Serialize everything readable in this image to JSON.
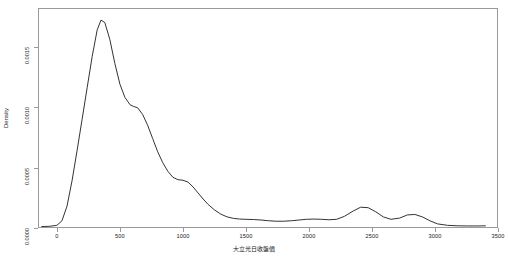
{
  "chart_data": {
    "type": "line",
    "title": "",
    "subtitle": "",
    "xlabel": "大立光日收盤價",
    "ylabel": "Density",
    "xlim": [
      -150,
      3500
    ],
    "ylim": [
      0,
      0.00182
    ],
    "grid": false,
    "legend": null,
    "x_ticks": [
      0,
      500,
      1000,
      1500,
      2000,
      2500,
      3000,
      3500
    ],
    "x_tick_labels": [
      "0",
      "500",
      "1000",
      "1500",
      "2000",
      "2500",
      "3000",
      "3500"
    ],
    "y_ticks": [
      0.0,
      0.0005,
      0.001,
      0.0015
    ],
    "y_tick_labels": [
      "0.0000",
      "0.0005",
      "0.0010",
      "0.0015"
    ],
    "line_color": "#333333",
    "series": [
      {
        "name": "Density",
        "x": [
          -120,
          -60,
          0,
          40,
          80,
          120,
          160,
          200,
          240,
          280,
          320,
          350,
          380,
          420,
          460,
          500,
          540,
          580,
          610,
          640,
          680,
          720,
          760,
          800,
          840,
          880,
          920,
          960,
          1000,
          1040,
          1080,
          1120,
          1160,
          1200,
          1250,
          1300,
          1350,
          1400,
          1450,
          1500,
          1560,
          1620,
          1680,
          1740,
          1800,
          1860,
          1920,
          1980,
          2040,
          2100,
          2160,
          2220,
          2280,
          2350,
          2410,
          2470,
          2530,
          2590,
          2650,
          2720,
          2780,
          2840,
          2900,
          2960,
          3020,
          3100,
          3180,
          3260,
          3340,
          3400
        ],
        "y": [
          1.2e-05,
          1.4e-05,
          2.2e-05,
          6e-05,
          0.00018,
          0.00039,
          0.00064,
          0.0009,
          0.00116,
          0.00142,
          0.00164,
          0.00172,
          0.0017,
          0.00156,
          0.00136,
          0.00119,
          0.00108,
          0.00102,
          0.001005,
          0.000995,
          0.00094,
          0.00085,
          0.00074,
          0.00063,
          0.00054,
          0.00047,
          0.00042,
          0.0004,
          0.000395,
          0.00038,
          0.00034,
          0.00029,
          0.00024,
          0.000195,
          0.00015,
          0.000115,
          9.2e-05,
          8e-05,
          7.4e-05,
          7.2e-05,
          7e-05,
          6.6e-05,
          6e-05,
          5.6e-05,
          5.6e-05,
          6e-05,
          6.6e-05,
          7.2e-05,
          7.4e-05,
          7.2e-05,
          6.8e-05,
          7.2e-05,
          9.6e-05,
          0.00014,
          0.000172,
          0.000168,
          0.000134,
          9.2e-05,
          7.2e-05,
          8.2e-05,
          0.000108,
          0.000112,
          9.2e-05,
          6e-05,
          3.4e-05,
          2.2e-05,
          1.8e-05,
          1.7e-05,
          1.7e-05,
          1.8e-05
        ]
      }
    ],
    "annotations": [
      {
        "name": "main-peak",
        "x": 350,
        "y": 0.00172
      },
      {
        "name": "shoulder",
        "x": 620,
        "y": 0.001
      },
      {
        "name": "ledge",
        "x": 1000,
        "y": 0.000395
      },
      {
        "name": "bump-1",
        "x": 2350,
        "y": 0.000172
      },
      {
        "name": "bump-2",
        "x": 2720,
        "y": 0.000112
      }
    ]
  }
}
